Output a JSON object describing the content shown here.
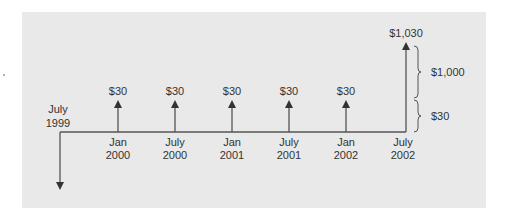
{
  "diagram": {
    "type": "cash-flow-timeline",
    "colors": {
      "panel_background": "#e9e9e9",
      "line": "#555555",
      "text": "#333333"
    },
    "initial_outflow": {
      "label_line1": "July",
      "label_line2": "1999",
      "direction": "down"
    },
    "inflows": [
      {
        "amount": "$30",
        "date_line1": "Jan",
        "date_line2": "2000"
      },
      {
        "amount": "$30",
        "date_line1": "July",
        "date_line2": "2000"
      },
      {
        "amount": "$30",
        "date_line1": "Jan",
        "date_line2": "2001"
      },
      {
        "amount": "$30",
        "date_line1": "July",
        "date_line2": "2001"
      },
      {
        "amount": "$30",
        "date_line1": "Jan",
        "date_line2": "2002"
      },
      {
        "amount": "$1,030",
        "date_line1": "July",
        "date_line2": "2002"
      }
    ],
    "braces": [
      {
        "label": "$1,000",
        "part": "principal"
      },
      {
        "label": "$30",
        "part": "coupon"
      }
    ]
  }
}
